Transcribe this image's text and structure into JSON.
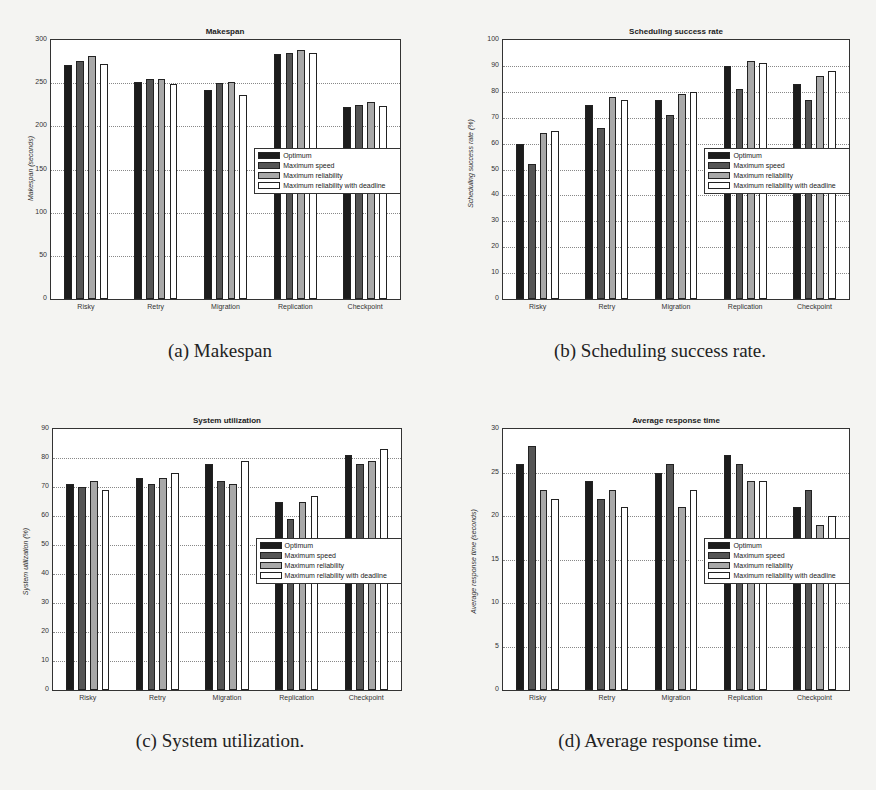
{
  "series_names": [
    "Optimum",
    "Maximum speed",
    "Maximum reliability",
    "Maximum reliability with deadline"
  ],
  "series_colors": [
    "#1c1c1c",
    "#555555",
    "#a8a8a8",
    "#ffffff"
  ],
  "categories": [
    "Risky",
    "Retry",
    "Migration",
    "Replication",
    "Checkpoint"
  ],
  "captions": {
    "a": "(a) Makespan",
    "b": "(b) Scheduling success rate.",
    "c": "(c) System utilization.",
    "d": "(d) Average response time."
  },
  "chart_data": [
    {
      "id": "a",
      "type": "bar",
      "title": "Makespan",
      "xlabel": "",
      "ylabel": "Makespan (seconds)",
      "ylim": [
        0,
        300
      ],
      "yticks": [
        0,
        50,
        100,
        150,
        200,
        250,
        300
      ],
      "grid": true,
      "legend_position": "center-right",
      "categories": [
        "Risky",
        "Retry",
        "Migration",
        "Replication",
        "Checkpoint"
      ],
      "series": [
        {
          "name": "Optimum",
          "values": [
            271,
            251,
            242,
            284,
            222
          ]
        },
        {
          "name": "Maximum speed",
          "values": [
            276,
            255,
            250,
            285,
            225
          ]
        },
        {
          "name": "Maximum reliability",
          "values": [
            282,
            255,
            251,
            288,
            228
          ]
        },
        {
          "name": "Maximum reliability with deadline",
          "values": [
            272,
            249,
            236,
            285,
            224
          ]
        }
      ]
    },
    {
      "id": "b",
      "type": "bar",
      "title": "Scheduling success rate",
      "xlabel": "",
      "ylabel": "Scheduling success rate (%)",
      "ylim": [
        0,
        100
      ],
      "yticks": [
        0,
        10,
        20,
        30,
        40,
        50,
        60,
        70,
        80,
        90,
        100
      ],
      "grid": true,
      "legend_position": "center-right",
      "categories": [
        "Risky",
        "Retry",
        "Migration",
        "Replication",
        "Checkpoint"
      ],
      "series": [
        {
          "name": "Optimum",
          "values": [
            60,
            75,
            77,
            90,
            83
          ]
        },
        {
          "name": "Maximum speed",
          "values": [
            52,
            66,
            71,
            81,
            77
          ]
        },
        {
          "name": "Maximum reliability",
          "values": [
            64,
            78,
            79,
            92,
            86
          ]
        },
        {
          "name": "Maximum reliability with deadline",
          "values": [
            65,
            77,
            80,
            91,
            88
          ]
        }
      ]
    },
    {
      "id": "c",
      "type": "bar",
      "title": "System utilization",
      "xlabel": "",
      "ylabel": "System utilization (%)",
      "ylim": [
        0,
        90
      ],
      "yticks": [
        0,
        10,
        20,
        30,
        40,
        50,
        60,
        70,
        80,
        90
      ],
      "grid": true,
      "legend_position": "center-right",
      "categories": [
        "Risky",
        "Retry",
        "Migration",
        "Replication",
        "Checkpoint"
      ],
      "series": [
        {
          "name": "Optimum",
          "values": [
            71,
            73,
            78,
            65,
            81
          ]
        },
        {
          "name": "Maximum speed",
          "values": [
            70,
            71,
            72,
            59,
            78
          ]
        },
        {
          "name": "Maximum reliability",
          "values": [
            72,
            73,
            71,
            65,
            79
          ]
        },
        {
          "name": "Maximum reliability with deadline",
          "values": [
            69,
            75,
            79,
            67,
            83
          ]
        }
      ]
    },
    {
      "id": "d",
      "type": "bar",
      "title": "Average response time",
      "xlabel": "",
      "ylabel": "Average response time (seconds)",
      "ylim": [
        0,
        30
      ],
      "yticks": [
        0,
        5,
        10,
        15,
        20,
        25,
        30
      ],
      "grid": true,
      "legend_position": "center-right",
      "categories": [
        "Risky",
        "Retry",
        "Migration",
        "Replication",
        "Checkpoint"
      ],
      "series": [
        {
          "name": "Optimum",
          "values": [
            26,
            24,
            25,
            27,
            21
          ]
        },
        {
          "name": "Maximum speed",
          "values": [
            28,
            22,
            26,
            26,
            23
          ]
        },
        {
          "name": "Maximum reliability",
          "values": [
            23,
            23,
            21,
            24,
            19
          ]
        },
        {
          "name": "Maximum reliability with deadline",
          "values": [
            22,
            21,
            23,
            24,
            20
          ]
        }
      ]
    }
  ]
}
